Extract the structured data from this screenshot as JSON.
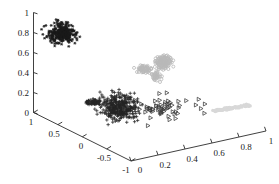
{
  "figure": {
    "kind": "3d-scatter-plot",
    "background": "#ffffff",
    "width": 279,
    "height": 184
  },
  "chart_data": {
    "type": "scatter",
    "title": "",
    "subtitle": "",
    "xlabel": "",
    "ylabel": "",
    "zlabel": "",
    "projection": "3d",
    "grid": false,
    "legend": "none",
    "axes": {
      "z": {
        "name": "vertical-axis",
        "ticks": [
          "0",
          "0.2",
          "0.4",
          "0.6",
          "0.8",
          "1"
        ],
        "values": [
          0,
          0.2,
          0.4,
          0.6,
          0.8,
          1
        ],
        "lim": [
          0,
          1
        ]
      },
      "x": {
        "name": "left-depth-axis",
        "ticks": [
          "1",
          "0.5",
          "0",
          "-0.5",
          "-1"
        ],
        "values": [
          1,
          0.5,
          0,
          -0.5,
          -1
        ],
        "lim": [
          1,
          -1
        ]
      },
      "y": {
        "name": "right-horizontal-axis",
        "ticks": [
          "0",
          "0.2",
          "0.4",
          "0.6",
          "0.8",
          "1"
        ],
        "values": [
          0,
          0.2,
          0.4,
          0.6,
          0.8,
          1
        ],
        "lim": [
          0,
          1
        ]
      }
    },
    "series": [
      {
        "name": "cluster-1-asterisk-upper-left",
        "marker": "asterisk",
        "color": "#1a1a1a",
        "point_count": 330,
        "center": [
          62,
          33
        ],
        "spread": [
          11,
          8
        ],
        "outliers": [
          [
            77,
            40
          ],
          [
            73,
            35
          ],
          [
            75,
            37
          ]
        ]
      },
      {
        "name": "cluster-2-circle-light-gray",
        "marker": "circle-open",
        "color": "#b9b9b9",
        "point_count": 240,
        "center": [
          158,
          65
        ],
        "spread": [
          16,
          8
        ],
        "outliers": [
          [
            137,
            72
          ],
          [
            160,
            82
          ],
          [
            155,
            80
          ]
        ]
      },
      {
        "name": "cluster-3-plus-dark",
        "marker": "plus",
        "color": "#262626",
        "point_count": 420,
        "center": [
          120,
          108
        ],
        "spread": [
          16,
          11
        ],
        "outliers": [
          [
            93,
            104
          ],
          [
            99,
            102
          ],
          [
            105,
            103
          ]
        ]
      },
      {
        "name": "cluster-4-triangle-right-scatter",
        "marker": "triangle-right",
        "color": "#3a3a3a",
        "point_count": 60,
        "center": [
          152,
          108
        ],
        "spread": [
          24,
          10
        ],
        "outliers": [
          [
            196,
            105
          ],
          [
            205,
            104
          ]
        ]
      },
      {
        "name": "cluster-5-streak-very-light",
        "marker": "dot-streak",
        "color": "#d8d8d8",
        "point_count": 120,
        "center": [
          232,
          108
        ],
        "spread": [
          18,
          3
        ],
        "outliers": []
      }
    ]
  },
  "ticks": {
    "z": {
      "t0": "0",
      "t1": "0.2",
      "t2": "0.4",
      "t3": "0.6",
      "t4": "0.8",
      "t5": "1"
    },
    "x": {
      "t0": "1",
      "t1": "0.5",
      "t2": "0",
      "t3": "-0.5",
      "t4": "-1"
    },
    "y": {
      "t0": "0",
      "t1": "0.2",
      "t2": "0.4",
      "t3": "0.6",
      "t4": "0.8",
      "t5": "1"
    }
  }
}
